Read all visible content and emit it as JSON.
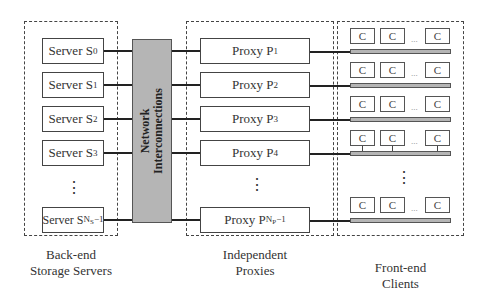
{
  "diagram": {
    "groups": {
      "servers": {
        "caption_line1": "Back-end",
        "caption_line2": "Storage Servers"
      },
      "proxies": {
        "caption_line1": "Independent",
        "caption_line2": "Proxies"
      },
      "clients": {
        "caption_line1": "Front-end",
        "caption_line2": "Clients"
      }
    },
    "network": {
      "line1": "Network",
      "line2": "Interconnections"
    },
    "servers": [
      {
        "prefix": "Server S",
        "sub": "0"
      },
      {
        "prefix": "Server S",
        "sub": "1"
      },
      {
        "prefix": "Server S",
        "sub": "2"
      },
      {
        "prefix": "Server S",
        "sub": "3"
      },
      {
        "prefix": "Server S",
        "sub": "N",
        "subsub": "S",
        "tail": "−1"
      }
    ],
    "proxies": [
      {
        "prefix": "Proxy P",
        "sub": "1"
      },
      {
        "prefix": "Proxy P",
        "sub": "2"
      },
      {
        "prefix": "Proxy P",
        "sub": "3"
      },
      {
        "prefix": "Proxy P",
        "sub": "4"
      },
      {
        "prefix": "Proxy P",
        "sub": "N",
        "subsub": "P",
        "tail": "−1"
      }
    ],
    "client_label": "C",
    "client_ellipsis": "...",
    "vertical_ellipsis": "⋮",
    "colors": {
      "network_fill": "#b5b5b5",
      "bus_fill": "#b5b5b5",
      "stroke": "#444444"
    }
  }
}
